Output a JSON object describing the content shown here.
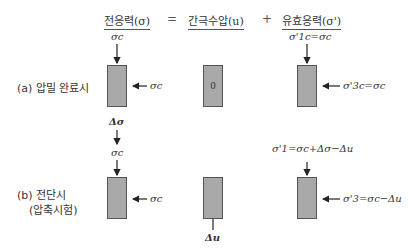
{
  "header": {
    "total_stress": "전응력(σ)",
    "equals": "=",
    "pore_pressure": "간극수압(u)",
    "plus": "+",
    "effective_stress": "유효응력(σ')"
  },
  "rows": {
    "a": {
      "label": "(a) 압밀 완료시",
      "total_top": "σc",
      "total_side": "σc",
      "pore_value": "0",
      "effective_top": "σ'1c=σc",
      "effective_side": "σ'3c=σc"
    },
    "transition": {
      "delta_sigma": "Δσ",
      "sigma_c": "σc"
    },
    "b": {
      "label_line1": "(b) 전단시",
      "label_line2": "(압축시험)",
      "total_side": "σc",
      "pore_bottom": "Δu",
      "effective_top": "σ'1=σc+Δσ−Δu",
      "effective_side": "σ'3=σc−Δu"
    }
  },
  "colors": {
    "box_fill": "#a9a9a9",
    "box_border": "#555555",
    "arrow": "#222222"
  }
}
